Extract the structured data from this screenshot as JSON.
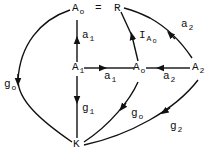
{
  "diagram": {
    "type": "commutative-diagram",
    "nodes": [
      {
        "id": "A0_top",
        "label": "A",
        "sub": "o"
      },
      {
        "id": "R",
        "label": "R",
        "sub": ""
      },
      {
        "id": "A1",
        "label": "A",
        "sub": "1"
      },
      {
        "id": "A0_mid",
        "label": "A",
        "sub": "o"
      },
      {
        "id": "A2",
        "label": "A",
        "sub": "2"
      },
      {
        "id": "K",
        "label": "K",
        "sub": ""
      }
    ],
    "equals": "=",
    "edges": [
      {
        "from": "A1",
        "to": "A0_top",
        "label": "a",
        "sub": "1"
      },
      {
        "from": "A1",
        "to": "A0_mid",
        "label": "a",
        "sub": "1"
      },
      {
        "from": "A2",
        "to": "A0_mid",
        "label": "a",
        "sub": "2"
      },
      {
        "from": "A0_mid",
        "to": "R",
        "label": "I",
        "sub": "A",
        "subsub": "o"
      },
      {
        "from": "A2",
        "to": "R",
        "label": "a",
        "sub": "2"
      },
      {
        "from": "A0_top",
        "to": "K",
        "label": "g",
        "sub": "o"
      },
      {
        "from": "A1",
        "to": "K",
        "label": "g",
        "sub": "1"
      },
      {
        "from": "A0_mid",
        "to": "K",
        "label": "g",
        "sub": "o"
      },
      {
        "from": "A2",
        "to": "K",
        "label": "g",
        "sub": "2"
      }
    ]
  }
}
